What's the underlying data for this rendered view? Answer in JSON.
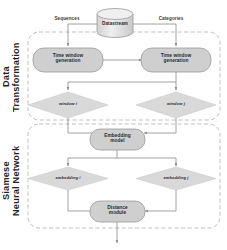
{
  "diagram": {
    "groups": [
      {
        "id": "data-transformation",
        "title": "Data\nTransformation"
      },
      {
        "id": "siamese-neural-network",
        "title": "Siamese\nNeural Network"
      }
    ],
    "source": {
      "label": "Datastream",
      "shape": "cylinder"
    },
    "edge_labels": [
      {
        "id": "sequences",
        "label": "Sequences"
      },
      {
        "id": "categories",
        "label": "Categories"
      }
    ],
    "nodes": [
      {
        "id": "time-window-generation-left",
        "label": "Time window\ngeneration",
        "shape": "rounded-box"
      },
      {
        "id": "time-window-generation-right",
        "label": "Time window\ngeneration",
        "shape": "rounded-box"
      },
      {
        "id": "window-i",
        "label": "window i",
        "shape": "diamond"
      },
      {
        "id": "window-j",
        "label": "window j",
        "shape": "diamond"
      },
      {
        "id": "embedding-model",
        "label": "Embedding\nmodel",
        "shape": "rounded-box"
      },
      {
        "id": "embedding-i",
        "label": "embedding i",
        "shape": "diamond"
      },
      {
        "id": "embedding-j",
        "label": "embedding j",
        "shape": "diamond"
      },
      {
        "id": "distance-module",
        "label": "Distance\nmodule",
        "shape": "rounded-box"
      }
    ],
    "colors": {
      "node_fill": "#cfcfcf",
      "node_stroke": "#9a9a9a",
      "diamond_fill": "#d9d9d9",
      "group_stroke": "#b7b7b7",
      "line": "#8c8c8c",
      "text": "#2b2b2b",
      "background": "#ffffff"
    }
  }
}
